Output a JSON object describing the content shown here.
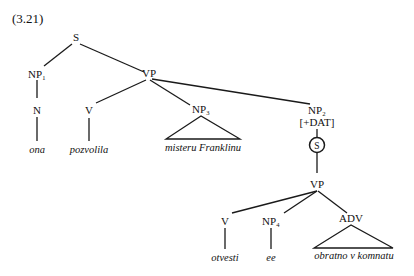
{
  "example_number": "(3.21)",
  "nodes": {
    "S": "S",
    "NP1": "NP₁",
    "N": "N",
    "VP1": "VP",
    "V1": "V",
    "NP3": "NP₃",
    "NP2": "NP₂",
    "NP2_feature": "[+DAT]",
    "S_embedded": "S",
    "VP2": "VP",
    "V2": "V",
    "NP4": "NP₄",
    "ADV": "ADV"
  },
  "words": {
    "ona": "ona",
    "pozvolila": "pozvolila",
    "misteru_franklinu": "misteru Franklinu",
    "otvesti": "otvesti",
    "ee": "ee",
    "obratno_v_komnatu": "obratno v komnatu"
  }
}
